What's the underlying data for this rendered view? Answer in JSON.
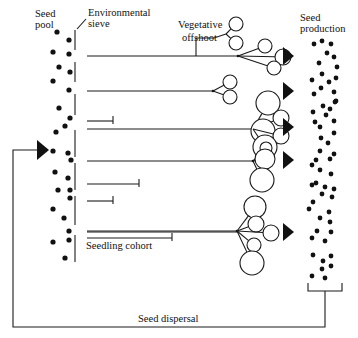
{
  "labels": {
    "seed_pool": [
      "Seed",
      "pool"
    ],
    "environmental_sieve": [
      "Environmental",
      "sieve"
    ],
    "vegetative_offshoot": [
      "Vegetative",
      "offshoot"
    ],
    "seed_production": [
      "Seed",
      "production"
    ],
    "seedling_cohort": "Seedling cohort",
    "seed_dispersal": "Seed dispersal"
  },
  "colors": {
    "ink": "#111111",
    "background": "#ffffff"
  },
  "seed_pool_dots": [
    [
      57,
      32
    ],
    [
      69,
      40
    ],
    [
      53,
      52
    ],
    [
      69,
      54
    ],
    [
      59,
      67
    ],
    [
      70,
      72
    ],
    [
      53,
      81
    ],
    [
      69,
      90
    ],
    [
      59,
      108
    ],
    [
      70,
      118
    ],
    [
      65,
      126
    ],
    [
      56,
      132
    ],
    [
      53,
      151
    ],
    [
      68,
      153
    ],
    [
      71,
      160
    ],
    [
      55,
      172
    ],
    [
      68,
      178
    ],
    [
      58,
      190
    ],
    [
      70,
      190
    ],
    [
      70,
      198
    ],
    [
      53,
      209
    ],
    [
      64,
      218
    ],
    [
      69,
      231
    ],
    [
      53,
      242
    ],
    [
      69,
      240
    ],
    [
      65,
      258
    ]
  ],
  "sieve_segments": [
    [
      30,
      50
    ],
    [
      62,
      82
    ],
    [
      94,
      115
    ],
    [
      130,
      157
    ],
    [
      163,
      190
    ],
    [
      196,
      225
    ],
    [
      235,
      262
    ]
  ],
  "sieve_x": 75,
  "shoots": [
    {
      "y": 56,
      "end_x": 238,
      "hub_x": 238,
      "circles": [
        [
          265,
          46,
          7
        ],
        [
          283,
          57,
          8
        ],
        [
          274,
          68,
          7
        ]
      ],
      "offshoot": {
        "x": 196,
        "top": 38,
        "circles": [
          [
            236,
            24,
            7
          ],
          [
            236,
            43,
            7
          ]
        ],
        "hub": [
          226,
          34
        ]
      }
    },
    {
      "y": 91,
      "end_x": 213,
      "hub_x": 213,
      "circles": [
        [
          230,
          82,
          7
        ],
        [
          230,
          97,
          7
        ]
      ]
    },
    {
      "y": 129,
      "end_x": 253,
      "hub_x": 253,
      "circles": [
        [
          268,
          103,
          12
        ],
        [
          281,
          118,
          8
        ],
        [
          263,
          131,
          12
        ],
        [
          281,
          136,
          8
        ],
        [
          265,
          147,
          12
        ]
      ]
    },
    {
      "y": 161,
      "end_x": 253,
      "hub_x": 253,
      "circles": [
        [
          266,
          148,
          6
        ],
        [
          265,
          159,
          10
        ],
        [
          262,
          180,
          12
        ]
      ]
    },
    {
      "y": 231,
      "end_x": 237,
      "hub_x": 237,
      "circles": [
        [
          255,
          207,
          11
        ],
        [
          256,
          224,
          8
        ],
        [
          271,
          233,
          8
        ],
        [
          254,
          245,
          7
        ],
        [
          252,
          263,
          12
        ]
      ]
    }
  ],
  "seedling_lines": [
    {
      "y": 121,
      "end_x": 113,
      "tick": true
    },
    {
      "y": 184,
      "end_x": 139,
      "tick": true
    },
    {
      "y": 201,
      "end_x": 113,
      "tick": true
    },
    {
      "y": 232,
      "end_x": 237,
      "tick": false
    },
    {
      "y": 238,
      "end_x": 172,
      "tick": true
    }
  ],
  "arrows_y": [
    56,
    91,
    127,
    160,
    232
  ],
  "arrow_x": 283,
  "production_dots": [
    [
      314,
      44
    ],
    [
      322,
      41
    ],
    [
      331,
      44
    ],
    [
      327,
      53
    ],
    [
      334,
      57
    ],
    [
      319,
      63
    ],
    [
      337,
      67
    ],
    [
      322,
      74
    ],
    [
      312,
      80
    ],
    [
      329,
      82
    ],
    [
      336,
      78
    ],
    [
      321,
      88
    ],
    [
      334,
      92
    ],
    [
      314,
      94
    ],
    [
      336,
      101
    ],
    [
      323,
      106
    ],
    [
      330,
      109
    ],
    [
      335,
      102
    ],
    [
      313,
      112
    ],
    [
      326,
      115
    ],
    [
      334,
      121
    ],
    [
      315,
      122
    ],
    [
      320,
      127
    ],
    [
      334,
      133
    ],
    [
      321,
      138
    ],
    [
      328,
      143
    ],
    [
      320,
      151
    ],
    [
      334,
      154
    ],
    [
      316,
      160
    ],
    [
      330,
      159
    ],
    [
      312,
      165
    ],
    [
      320,
      170
    ],
    [
      331,
      174
    ],
    [
      316,
      183
    ],
    [
      325,
      187
    ],
    [
      312,
      185
    ],
    [
      334,
      189
    ],
    [
      322,
      194
    ],
    [
      332,
      197
    ],
    [
      313,
      202
    ],
    [
      329,
      212
    ],
    [
      309,
      209
    ],
    [
      320,
      218
    ],
    [
      330,
      222
    ],
    [
      317,
      231
    ],
    [
      331,
      232
    ],
    [
      312,
      238
    ],
    [
      325,
      241
    ],
    [
      331,
      256
    ],
    [
      323,
      261
    ],
    [
      313,
      255
    ],
    [
      331,
      266
    ],
    [
      322,
      269
    ],
    [
      312,
      276
    ],
    [
      325,
      278
    ]
  ],
  "bracket": {
    "x1": 308,
    "x2": 342,
    "top": 283,
    "bottom": 291,
    "stem_x": 325
  },
  "dispersal_path": {
    "bottom_y": 327,
    "left_x": 13,
    "arrow_y": 150
  }
}
